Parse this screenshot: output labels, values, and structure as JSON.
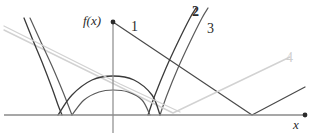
{
  "figure": {
    "title": "",
    "axes": {
      "y_axis_label": "f(x)",
      "x_axis_label": "x",
      "origin": {
        "x": 113,
        "y": 115
      },
      "x_axis": {
        "x_start": 4,
        "x_end": 305,
        "y": 115,
        "end_marker": "dot"
      },
      "y_axis": {
        "x": 113,
        "y_start": 22,
        "y_end": 133,
        "top_marker": "dot"
      }
    },
    "curve_labels": [
      {
        "id": "1",
        "text": "1",
        "color": "#4a4a4a",
        "style": "normal"
      },
      {
        "id": "2",
        "text": "2",
        "color": "#2b2b2b",
        "style": "bold"
      },
      {
        "id": "3",
        "text": "3",
        "color": "#2b2b2b",
        "style": "normal"
      },
      {
        "id": "4",
        "text": "4",
        "color": "#cfcfcf",
        "style": "normal"
      }
    ],
    "colors": {
      "axis": "#8a8a8a",
      "dark_curve": "#3a3a3a",
      "mid_curve": "#5a5a5a",
      "light_curve": "#d2d2d2",
      "label": "#2b2b2b"
    }
  },
  "chart_data": {
    "type": "line",
    "title": "",
    "xlabel": "x",
    "ylabel": "f(x)",
    "grid": false,
    "legend": "inline-curve-numbers",
    "xlim": [
      4,
      305
    ],
    "ylim": [
      0,
      140
    ],
    "note": "Pixel-space polylines/curves as drawn in the figure (screen coords, y down).",
    "series": [
      {
        "name": "1",
        "label": "1",
        "kind": "polyline",
        "color": "#4a4a4a",
        "width": 1.2,
        "points": [
          [
            113,
            22
          ],
          [
            252,
            115
          ],
          [
            305,
            87
          ]
        ]
      },
      {
        "name": "2",
        "label": "2",
        "kind": "parabola-right",
        "color": "#3a3a3a",
        "width": 1.3,
        "points": [
          [
            148,
            115
          ],
          [
            155,
            95
          ],
          [
            166,
            68
          ],
          [
            178,
            42
          ],
          [
            190,
            18
          ],
          [
            196,
            8
          ]
        ]
      },
      {
        "name": "3",
        "label": "3",
        "kind": "parabola-right",
        "color": "#5a5a5a",
        "width": 1.2,
        "points": [
          [
            160,
            115
          ],
          [
            167,
            95
          ],
          [
            178,
            68
          ],
          [
            190,
            42
          ],
          [
            202,
            18
          ],
          [
            208,
            8
          ]
        ]
      },
      {
        "name": "4",
        "label": "4",
        "kind": "polyline",
        "color": "#d2d2d2",
        "width": 1.4,
        "points": [
          [
            4,
            30
          ],
          [
            173,
            113
          ],
          [
            290,
            57
          ]
        ]
      },
      {
        "name": "left-parabola-outer",
        "label": "",
        "kind": "parabola-left",
        "color": "#3a3a3a",
        "width": 1.3,
        "points": [
          [
            24,
            18
          ],
          [
            32,
            38
          ],
          [
            42,
            62
          ],
          [
            52,
            88
          ],
          [
            58,
            105
          ],
          [
            62,
            115
          ]
        ]
      },
      {
        "name": "left-parabola-inner",
        "label": "",
        "kind": "parabola-left",
        "color": "#5a5a5a",
        "width": 1.2,
        "points": [
          [
            30,
            18
          ],
          [
            40,
            40
          ],
          [
            52,
            66
          ],
          [
            63,
            92
          ],
          [
            70,
            110
          ],
          [
            72,
            115
          ]
        ]
      },
      {
        "name": "dome-outer",
        "label": "",
        "kind": "arc",
        "color": "#3a3a3a",
        "width": 1.3,
        "points": [
          [
            58,
            115
          ],
          [
            72,
            95
          ],
          [
            92,
            80
          ],
          [
            113,
            76
          ],
          [
            134,
            80
          ],
          [
            152,
            95
          ],
          [
            160,
            115
          ]
        ]
      },
      {
        "name": "dome-inner",
        "label": "",
        "kind": "arc",
        "color": "#5a5a5a",
        "width": 1.2,
        "points": [
          [
            72,
            115
          ],
          [
            84,
            100
          ],
          [
            99,
            92
          ],
          [
            113,
            90
          ],
          [
            128,
            92
          ],
          [
            142,
            100
          ],
          [
            150,
            115
          ]
        ]
      },
      {
        "name": "light-diagonal",
        "label": "",
        "kind": "polyline",
        "color": "#d2d2d2",
        "width": 1.3,
        "points": [
          [
            4,
            26
          ],
          [
            120,
            84
          ],
          [
            180,
            112
          ]
        ]
      }
    ]
  }
}
